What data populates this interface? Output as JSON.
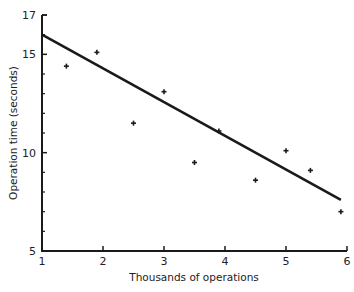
{
  "chart_data": {
    "type": "scatter",
    "title": "",
    "xlabel": "Thousands of operations",
    "ylabel": "Operation time (seconds)",
    "xlim": [
      1,
      6
    ],
    "ylim": [
      5,
      17
    ],
    "x_ticks": [
      1,
      2,
      3,
      4,
      5,
      6
    ],
    "y_ticks_labeled": [
      5,
      10,
      15,
      17
    ],
    "y_minor_ticks": [
      6,
      7,
      8,
      9,
      11,
      12,
      13,
      14,
      16
    ],
    "grid": false,
    "legend": null,
    "series": [
      {
        "name": "observations",
        "kind": "scatter",
        "marker": "plus",
        "points": [
          {
            "x": 1.4,
            "y": 14.4
          },
          {
            "x": 1.9,
            "y": 15.1
          },
          {
            "x": 2.5,
            "y": 11.5
          },
          {
            "x": 3.0,
            "y": 13.1
          },
          {
            "x": 3.5,
            "y": 9.5
          },
          {
            "x": 3.9,
            "y": 11.1
          },
          {
            "x": 4.5,
            "y": 8.6
          },
          {
            "x": 5.0,
            "y": 10.1
          },
          {
            "x": 5.4,
            "y": 9.1
          },
          {
            "x": 5.9,
            "y": 7.0
          }
        ]
      },
      {
        "name": "fitted regression line",
        "kind": "line",
        "points": [
          {
            "x": 1.0,
            "y": 16.0
          },
          {
            "x": 5.9,
            "y": 7.6
          }
        ]
      }
    ]
  },
  "colors": {
    "ink": "#1a1a1a",
    "background": "#ffffff"
  }
}
